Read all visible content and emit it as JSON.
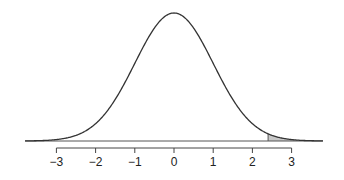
{
  "chart_data": {
    "type": "line",
    "title": "",
    "xlabel": "",
    "ylabel": "",
    "distribution": {
      "name": "normal",
      "mean": 0,
      "sd": 1
    },
    "xlim": [
      -3.8,
      3.8
    ],
    "x_ticks": [
      -3,
      -2,
      -1,
      0,
      1,
      2,
      3
    ],
    "x_tick_labels": [
      "−3",
      "−2",
      "−1",
      "0",
      "1",
      "2",
      "3"
    ],
    "shaded_region": {
      "from": 2.4,
      "to": 3.8,
      "color": "#c8c8c8"
    },
    "curve_color": "#333333",
    "grid": false,
    "y_axis_shown": false,
    "legend": null
  }
}
